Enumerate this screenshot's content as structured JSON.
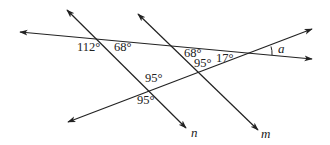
{
  "diagram": {
    "type": "geometry-transversal",
    "lines": [
      {
        "id": "transversal",
        "label": ""
      },
      {
        "id": "n",
        "label": "n"
      },
      {
        "id": "m",
        "label": "m"
      },
      {
        "id": "rising",
        "label": ""
      }
    ],
    "angles": [
      {
        "id": "angle-112",
        "text": "112°"
      },
      {
        "id": "angle-68-left",
        "text": "68°"
      },
      {
        "id": "angle-68-right",
        "text": "68°"
      },
      {
        "id": "angle-95-upper-m",
        "text": "95°"
      },
      {
        "id": "angle-17",
        "text": "17°"
      },
      {
        "id": "angle-95-upper-n",
        "text": "95°"
      },
      {
        "id": "angle-95-lower-n",
        "text": "95°"
      },
      {
        "id": "angle-a",
        "text": "a"
      }
    ],
    "colors": {
      "stroke": "#222222",
      "background": "#ffffff"
    }
  }
}
